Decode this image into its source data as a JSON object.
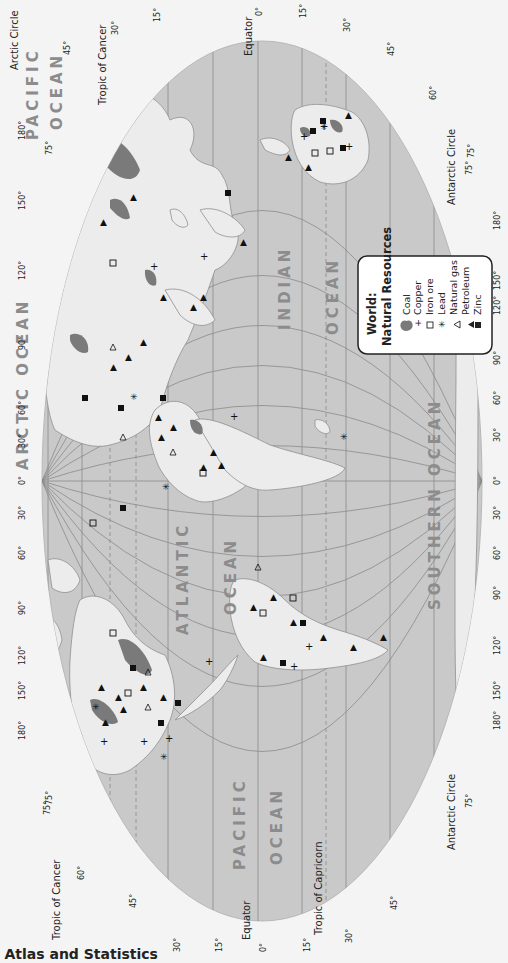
{
  "map": {
    "title_line1": "World:",
    "title_line2": "Natural Resources",
    "orientation": "rotated 90° clockwise (north at left)",
    "colors": {
      "ocean": "#c9c9c9",
      "land": "#ececec",
      "coal": "#7a7a7a",
      "grid": "#8a8a8a",
      "ocean_label": "#8c8c8c",
      "page": "#f4f4f4"
    },
    "legend": {
      "title_line1": "World:",
      "title_line2": "Natural Resources",
      "items": [
        {
          "symbol": "coal-blob",
          "glyph": "●",
          "label": "Coal"
        },
        {
          "symbol": "plus",
          "glyph": "+",
          "label": "Copper"
        },
        {
          "symbol": "open-square",
          "glyph": "□",
          "label": "Iron ore"
        },
        {
          "symbol": "asterisk",
          "glyph": "✳",
          "label": "Lead"
        },
        {
          "symbol": "open-triangle",
          "glyph": "△",
          "label": "Natural gas"
        },
        {
          "symbol": "filled-triangle",
          "glyph": "▲",
          "label": "Petroleum"
        },
        {
          "symbol": "filled-square",
          "glyph": "■",
          "label": "Zinc"
        }
      ]
    },
    "oceans": [
      {
        "name": "ARCTIC OCEAN"
      },
      {
        "name": "PACIFIC",
        "name2": "OCEAN",
        "side": "east"
      },
      {
        "name": "ATLANTIC",
        "name2": "OCEAN"
      },
      {
        "name": "INDIAN",
        "name2": "OCEAN"
      },
      {
        "name": "SOUTHERN OCEAN"
      },
      {
        "name": "PACIFIC",
        "name2": "OCEAN",
        "side": "west"
      }
    ],
    "latitude_lines": {
      "top_edge_labels": [
        "45°",
        "30°",
        "15°",
        "0°",
        "15°",
        "30°",
        "45°",
        "60°",
        "75°"
      ],
      "bottom_edge_labels": [
        "75°",
        "60°",
        "45°",
        "30°",
        "15°",
        "0°",
        "15°",
        "30°",
        "45°"
      ],
      "named": {
        "tropic_cancer": "Tropic of Cancer",
        "equator": "Equator",
        "tropic_capricorn": "Tropic of Capricorn",
        "arctic_circle": "Arctic Circle",
        "antarctic_circle": "Antarctic Circle"
      }
    },
    "longitude_labels": {
      "left_edge": [
        "180°",
        "150°",
        "120°",
        "90°",
        "60°",
        "30°",
        "0°",
        "30°",
        "60°",
        "90°",
        "120°",
        "150°",
        "180°"
      ],
      "right_edge": [
        "180°",
        "150°",
        "120°",
        "90°",
        "60°",
        "30°",
        "0°",
        "30°",
        "60°",
        "90°",
        "120°",
        "150°",
        "180°"
      ],
      "top_75": "75°",
      "bottom_75": "75°"
    }
  },
  "footer": {
    "text": ": Atlas and Statistics"
  }
}
